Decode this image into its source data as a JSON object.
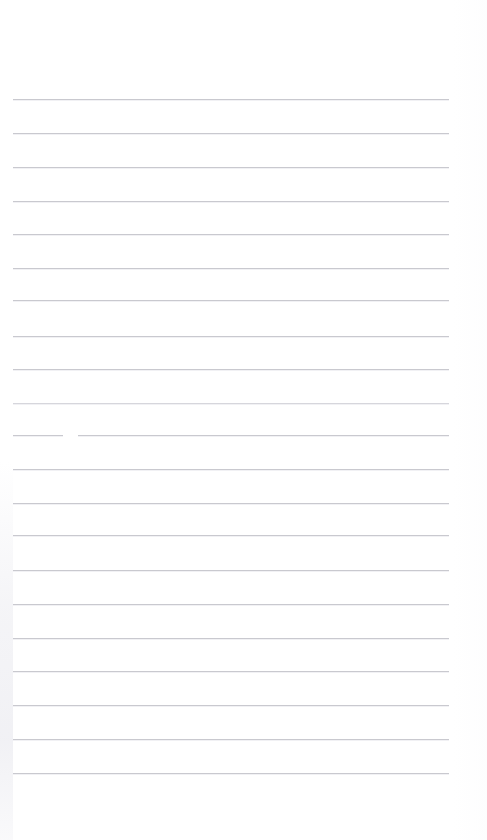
{
  "document": {
    "kind": "lined-notebook-page",
    "title": "Lined Notebook Page",
    "page_width": 487,
    "page_height": 840,
    "background_color": "#ffffff",
    "content_text": "",
    "is_blank": "true"
  },
  "ruling": {
    "line_color": "#c9c9cf",
    "line_color_light": "#d6d6dc",
    "line_thickness_px": 1,
    "line_spacing_px": 33.7,
    "first_line_y": 99,
    "left_margin_x": 13,
    "right_margin_x": 449,
    "line_count": 21,
    "lines": [
      {
        "y": 99,
        "x": 13,
        "width": 436,
        "tone": "normal"
      },
      {
        "y": 133,
        "x": 13,
        "width": 436,
        "tone": "normal"
      },
      {
        "y": 167,
        "x": 13,
        "width": 436,
        "tone": "normal"
      },
      {
        "y": 201,
        "x": 13,
        "width": 436,
        "tone": "normal"
      },
      {
        "y": 234,
        "x": 13,
        "width": 436,
        "tone": "normal"
      },
      {
        "y": 268,
        "x": 13,
        "width": 436,
        "tone": "normal"
      },
      {
        "y": 300,
        "x": 13,
        "width": 436,
        "tone": "normal"
      },
      {
        "y": 336,
        "x": 13,
        "width": 436,
        "tone": "normal"
      },
      {
        "y": 369,
        "x": 13,
        "width": 436,
        "tone": "normal"
      },
      {
        "y": 403,
        "x": 13,
        "width": 436,
        "tone": "light"
      },
      {
        "y": 435,
        "x": 13,
        "width": 436,
        "tone": "normal"
      },
      {
        "y": 469,
        "x": 13,
        "width": 436,
        "tone": "normal"
      },
      {
        "y": 503,
        "x": 13,
        "width": 436,
        "tone": "normal"
      },
      {
        "y": 535,
        "x": 13,
        "width": 436,
        "tone": "normal"
      },
      {
        "y": 570,
        "x": 13,
        "width": 436,
        "tone": "normal"
      },
      {
        "y": 604,
        "x": 13,
        "width": 436,
        "tone": "normal"
      },
      {
        "y": 638,
        "x": 13,
        "width": 436,
        "tone": "normal"
      },
      {
        "y": 671,
        "x": 13,
        "width": 436,
        "tone": "normal"
      },
      {
        "y": 705,
        "x": 13,
        "width": 436,
        "tone": "normal"
      },
      {
        "y": 739,
        "x": 13,
        "width": 436,
        "tone": "normal"
      },
      {
        "y": 773,
        "x": 13,
        "width": 436,
        "tone": "normal"
      }
    ],
    "gaps": [
      {
        "y": 434,
        "x": 63,
        "width": 15
      }
    ]
  }
}
